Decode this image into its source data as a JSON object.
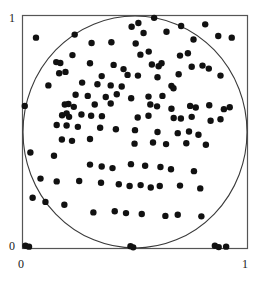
{
  "figure": {
    "background_color": "#ffffff",
    "frame_color": "#4d4d4d",
    "point_color": "#111111",
    "circle_color": "#3a3a3a"
  },
  "axes": {
    "x_tick_labels": [
      "0",
      "1"
    ],
    "y_tick_labels": [
      "0",
      "1"
    ],
    "x_min_label": "0",
    "x_max_label": "1",
    "y_min_label": "0",
    "y_max_label": "1"
  },
  "chart_data": {
    "type": "scatter",
    "title": "",
    "xlabel": "",
    "ylabel": "",
    "xlim": [
      0,
      1
    ],
    "ylim": [
      0,
      1
    ],
    "xticks": [
      0,
      1
    ],
    "yticks": [
      0,
      1
    ],
    "grid": false,
    "legend": false,
    "marker": "filled-circle",
    "marker_size_px": 3.2,
    "n_points": 120,
    "annotations": [
      {
        "type": "circle",
        "description": "unit circle inscribed in the unit square, centered at (0.5, 0.5) with radius 0.5",
        "cx": 0.5,
        "cy": 0.5,
        "r": 0.5,
        "stroke": "#3a3a3a",
        "fill": "none"
      }
    ],
    "x": [
      0.06,
      0.232,
      0.307,
      0.395,
      0.485,
      0.515,
      0.538,
      0.585,
      0.64,
      0.705,
      0.76,
      0.812,
      0.87,
      0.93,
      0.222,
      0.503,
      0.524,
      0.561,
      0.7,
      0.735,
      0.15,
      0.168,
      0.3,
      0.405,
      0.449,
      0.575,
      0.605,
      0.618,
      0.752,
      0.8,
      0.828,
      0.163,
      0.191,
      0.352,
      0.467,
      0.513,
      0.6,
      0.694,
      0.88,
      0.115,
      0.265,
      0.333,
      0.392,
      0.441,
      0.662,
      0.671,
      0.236,
      0.29,
      0.37,
      0.419,
      0.483,
      0.56,
      0.622,
      0.01,
      0.188,
      0.204,
      0.228,
      0.321,
      0.392,
      0.568,
      0.598,
      0.662,
      0.745,
      0.77,
      0.83,
      0.895,
      0.921,
      0.176,
      0.196,
      0.207,
      0.262,
      0.305,
      0.353,
      0.512,
      0.56,
      0.672,
      0.704,
      0.752,
      0.836,
      0.88,
      0.152,
      0.196,
      0.246,
      0.345,
      0.415,
      0.5,
      0.6,
      0.69,
      0.74,
      0.782,
      0.175,
      0.22,
      0.3,
      0.498,
      0.58,
      0.638,
      0.728,
      0.815,
      0.035,
      0.14,
      0.3,
      0.352,
      0.4,
      0.482,
      0.545,
      0.613,
      0.66,
      0.762,
      0.08,
      0.152,
      0.252,
      0.349,
      0.428,
      0.476,
      0.525,
      0.57,
      0.61,
      0.7,
      0.79,
      0.045,
      0.102,
      0.186,
      0.315,
      0.41,
      0.46,
      0.53,
      0.635,
      0.69,
      0.795,
      0.013,
      0.029,
      0.48,
      0.492,
      0.855,
      0.872,
      0.905
    ],
    "y": [
      0.905,
      0.918,
      0.882,
      0.885,
      0.952,
      0.968,
      0.925,
      0.99,
      0.93,
      0.955,
      0.897,
      0.962,
      0.912,
      0.905,
      0.83,
      0.88,
      0.832,
      0.845,
      0.828,
      0.838,
      0.8,
      0.796,
      0.795,
      0.788,
      0.77,
      0.79,
      0.782,
      0.795,
      0.78,
      0.785,
      0.772,
      0.752,
      0.758,
      0.74,
      0.745,
      0.742,
      0.735,
      0.748,
      0.742,
      0.7,
      0.712,
      0.705,
      0.7,
      0.695,
      0.698,
      0.688,
      0.66,
      0.655,
      0.65,
      0.662,
      0.645,
      0.652,
      0.655,
      0.612,
      0.618,
      0.62,
      0.608,
      0.618,
      0.622,
      0.618,
      0.61,
      0.6,
      0.612,
      0.605,
      0.615,
      0.598,
      0.606,
      0.572,
      0.58,
      0.565,
      0.575,
      0.57,
      0.568,
      0.562,
      0.57,
      0.56,
      0.558,
      0.565,
      0.548,
      0.555,
      0.53,
      0.528,
      0.522,
      0.518,
      0.512,
      0.508,
      0.5,
      0.495,
      0.502,
      0.488,
      0.468,
      0.462,
      0.47,
      0.45,
      0.455,
      0.448,
      0.452,
      0.445,
      0.412,
      0.398,
      0.36,
      0.352,
      0.345,
      0.362,
      0.355,
      0.35,
      0.34,
      0.332,
      0.3,
      0.288,
      0.29,
      0.282,
      0.276,
      0.268,
      0.272,
      0.262,
      0.268,
      0.27,
      0.258,
      0.218,
      0.2,
      0.188,
      0.155,
      0.16,
      0.152,
      0.148,
      0.14,
      0.145,
      0.138,
      0.012,
      0.008,
      0.01,
      0.005,
      0.012,
      0.006,
      0.008
    ]
  }
}
